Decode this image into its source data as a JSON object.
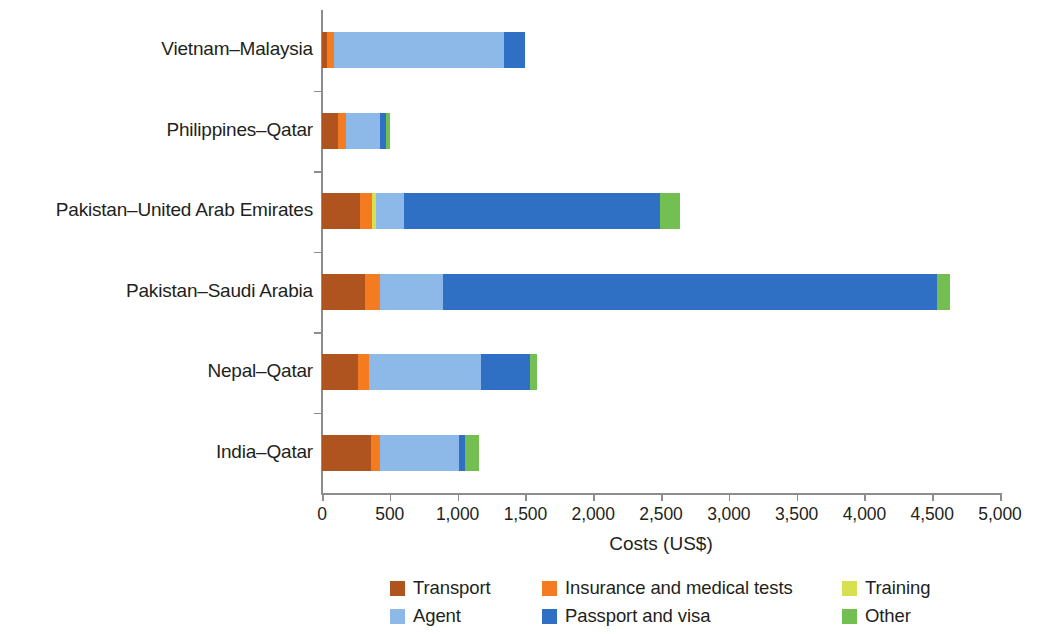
{
  "chart_data": {
    "type": "bar",
    "orientation": "horizontal",
    "stacked": true,
    "title": "",
    "xlabel": "Costs (US$)",
    "ylabel": "",
    "xlim": [
      0,
      5000
    ],
    "xticks": [
      0,
      500,
      1000,
      1500,
      2000,
      2500,
      3000,
      3500,
      4000,
      4500,
      5000
    ],
    "xtick_labels": [
      "0",
      "500",
      "1,000",
      "1,500",
      "2,000",
      "2,500",
      "3,000",
      "3,500",
      "4,000",
      "4,500",
      "5,000"
    ],
    "grid": false,
    "legend_position": "bottom",
    "categories": [
      "Vietnam–Malaysia",
      "Philippines–Qatar",
      "Pakistan–United Arab Emirates",
      "Pakistan–Saudi Arabia",
      "Nepal–Qatar",
      "India–Qatar"
    ],
    "series": [
      {
        "name": "Transport",
        "color": "#b0541f",
        "values": [
          37,
          118,
          280,
          317,
          265,
          361
        ]
      },
      {
        "name": "Insurance and medical tests",
        "color": "#f47b20",
        "values": [
          52,
          59,
          88,
          111,
          81,
          66
        ]
      },
      {
        "name": "Training",
        "color": "#d7e04e",
        "values": [
          0,
          0,
          30,
          0,
          0,
          0
        ]
      },
      {
        "name": "Agent",
        "color": "#8cb9e8",
        "values": [
          1254,
          251,
          206,
          465,
          826,
          583
        ]
      },
      {
        "name": "Passport and visa",
        "color": "#2f6fc4",
        "values": [
          155,
          44,
          1888,
          3644,
          361,
          44
        ]
      },
      {
        "name": "Other",
        "color": "#74bf51",
        "values": [
          0,
          30,
          148,
          96,
          52,
          103
        ]
      }
    ],
    "totals": [
      1498,
      502,
      2640,
      4633,
      1585,
      1157
    ]
  },
  "legend": {
    "row1": [
      {
        "label": "Transport",
        "color": "#b0541f"
      },
      {
        "label": "Insurance and medical tests",
        "color": "#f47b20"
      },
      {
        "label": "Training",
        "color": "#d7e04e"
      }
    ],
    "row2": [
      {
        "label": "Agent",
        "color": "#8cb9e8"
      },
      {
        "label": "Passport and visa",
        "color": "#2f6fc4"
      },
      {
        "label": "Other",
        "color": "#74bf51"
      }
    ]
  },
  "axis": {
    "x_title": "Costs (US$)"
  }
}
